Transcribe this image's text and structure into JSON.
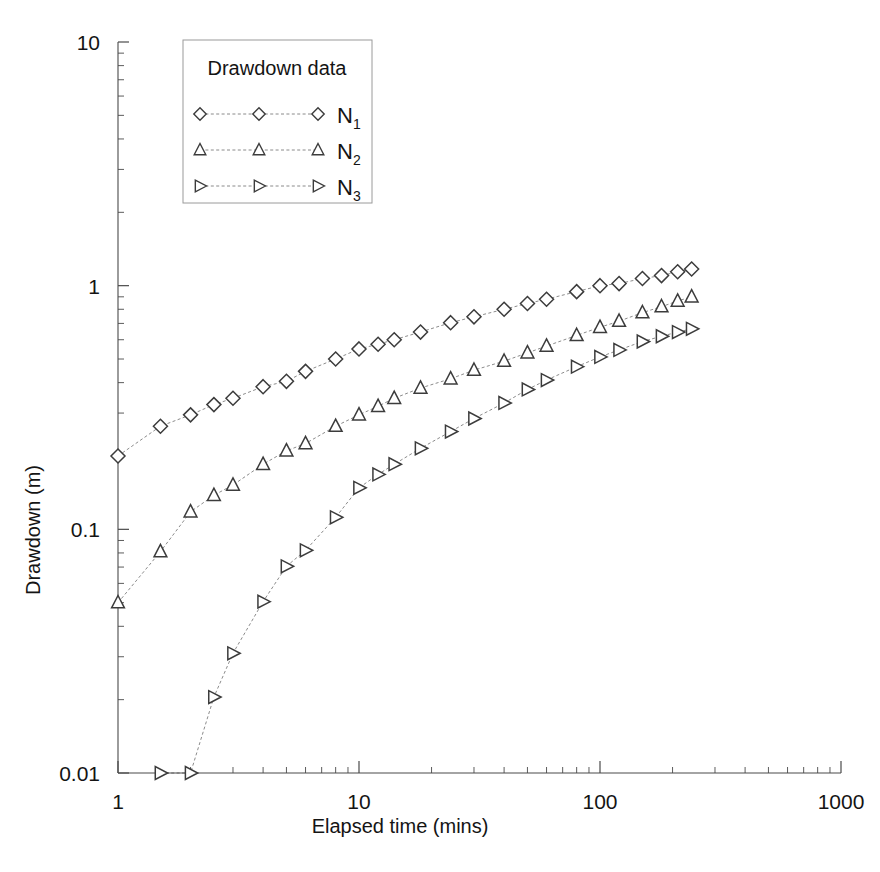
{
  "chart_data": {
    "type": "line",
    "title": "",
    "xlabel": "Elapsed time (mins)",
    "ylabel": "Drawdown (m)",
    "xscale": "log",
    "yscale": "log",
    "xlim": [
      1,
      1000
    ],
    "ylim": [
      0.01,
      10
    ],
    "xticks": [
      "1",
      "10",
      "100",
      "1000"
    ],
    "xtick_values": [
      1,
      10,
      100,
      1000
    ],
    "yticks": [
      "0.01",
      "0.1",
      "1",
      "10"
    ],
    "ytick_values": [
      0.01,
      0.1,
      1,
      10
    ],
    "grid": false,
    "legend_position": "upper-left-inside",
    "legend_title": "Drawdown data",
    "series": [
      {
        "name": "N1",
        "label_base": "N",
        "label_sub": "1",
        "marker": "diamond",
        "color": "#3c3c3c",
        "x": [
          1,
          1.5,
          2,
          2.5,
          3,
          4,
          5,
          6,
          8,
          10,
          12,
          14,
          18,
          24,
          30,
          40,
          50,
          60,
          80,
          100,
          120,
          150,
          180,
          210,
          240
        ],
        "y": [
          0.2,
          0.265,
          0.295,
          0.325,
          0.345,
          0.385,
          0.405,
          0.445,
          0.5,
          0.55,
          0.575,
          0.6,
          0.645,
          0.705,
          0.745,
          0.8,
          0.845,
          0.88,
          0.945,
          1.0,
          1.02,
          1.07,
          1.1,
          1.14,
          1.17
        ]
      },
      {
        "name": "N2",
        "label_base": "N",
        "label_sub": "2",
        "marker": "triangle-up",
        "color": "#3c3c3c",
        "x": [
          1,
          1.5,
          2,
          2.5,
          3,
          4,
          5,
          6,
          8,
          10,
          12,
          14,
          18,
          24,
          30,
          40,
          50,
          60,
          80,
          100,
          120,
          150,
          180,
          210,
          240
        ],
        "y": [
          0.05,
          0.081,
          0.118,
          0.138,
          0.152,
          0.185,
          0.21,
          0.225,
          0.265,
          0.295,
          0.32,
          0.345,
          0.38,
          0.415,
          0.45,
          0.49,
          0.53,
          0.565,
          0.625,
          0.675,
          0.715,
          0.775,
          0.82,
          0.865,
          0.9
        ]
      },
      {
        "name": "N3",
        "label_base": "N",
        "label_sub": "3",
        "marker": "triangle-right",
        "color": "#3c3c3c",
        "x": [
          1.5,
          2,
          2.5,
          3,
          4,
          5,
          6,
          8,
          10,
          12,
          14,
          18,
          24,
          30,
          40,
          50,
          60,
          80,
          100,
          120,
          150,
          180,
          210,
          240
        ],
        "y": [
          0.01,
          0.01,
          0.0205,
          0.031,
          0.0505,
          0.0705,
          0.082,
          0.112,
          0.148,
          0.168,
          0.185,
          0.215,
          0.252,
          0.285,
          0.33,
          0.375,
          0.41,
          0.465,
          0.51,
          0.545,
          0.59,
          0.62,
          0.645,
          0.665
        ]
      }
    ]
  }
}
